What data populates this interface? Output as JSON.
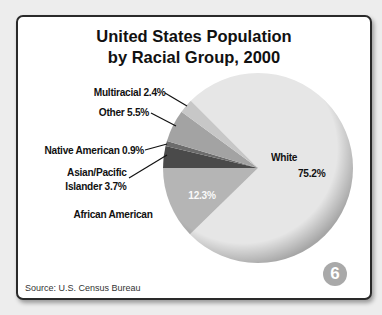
{
  "chart_data": {
    "type": "pie",
    "title": "United States Population by Racial Group, 2000",
    "title_lines": [
      "United States Population",
      "by Racial Group, 2000"
    ],
    "source": "Source: U.S. Census Bureau",
    "figure_number": "6",
    "unit": "%",
    "slices": [
      {
        "label": "White",
        "value": 75.2,
        "color": "#e6e6e6"
      },
      {
        "label": "African American",
        "value": 12.3,
        "color": "#b5b5b5"
      },
      {
        "label": "Asian/Pacific Islander",
        "value": 3.7,
        "color": "#4a4a4a"
      },
      {
        "label": "Native American",
        "value": 0.9,
        "color": "#6c6c6c"
      },
      {
        "label": "Other",
        "value": 5.5,
        "color": "#a3a3a3"
      },
      {
        "label": "Multiracial",
        "value": 2.4,
        "color": "#c7c7c7"
      }
    ]
  },
  "labels": {
    "multiracial": "Multiracial 2.4%",
    "other": "Other  5.5%",
    "native_american": "Native American  0.9%",
    "asian_line1": "Asian/Pacific",
    "asian_line2": "Islander  3.7%",
    "african_american": "African American",
    "african_american_value": "12.3%",
    "white": "White",
    "white_value": "75.2%"
  }
}
